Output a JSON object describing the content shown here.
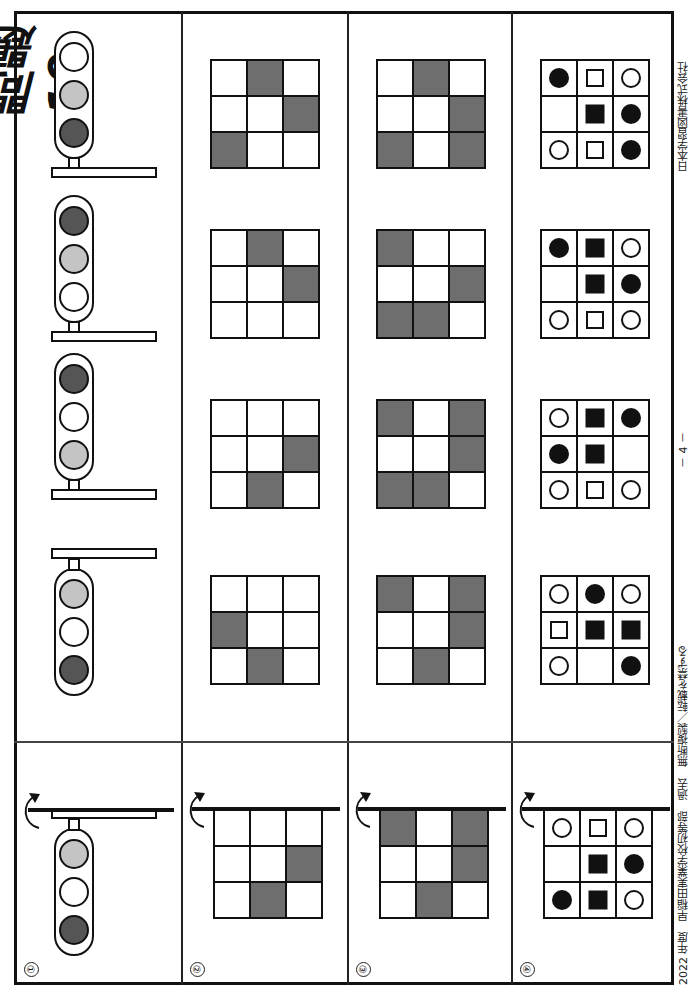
{
  "page": {
    "title": "問題19",
    "footer_left": "2022 年度　早稲田実業学校初等部　過去　無断複製／転載を禁ずる",
    "page_number": "－ 4 －",
    "footer_right": "日本学習図書株式会社"
  },
  "colors": {
    "dark_lamp": "#555555",
    "light_lamp": "#c4c4c4",
    "white_lamp": "#ffffff",
    "grid_fill": "#6e6e6e",
    "ink": "#111111"
  },
  "rows": [
    {
      "number": "①",
      "type": "traffic-light",
      "example": {
        "arm": "top",
        "lamps": [
          "light",
          "white",
          "dark"
        ]
      },
      "options": [
        {
          "arm": "bottom",
          "lamps": [
            "white",
            "light",
            "dark"
          ]
        },
        {
          "arm": "bottom",
          "lamps": [
            "dark",
            "light",
            "white"
          ]
        },
        {
          "arm": "bottom",
          "lamps": [
            "dark",
            "white",
            "light"
          ]
        },
        {
          "arm": "top",
          "lamps": [
            "light",
            "white",
            "dark"
          ]
        }
      ]
    },
    {
      "number": "②",
      "type": "shaded-grid",
      "example": [
        [
          0,
          0,
          0
        ],
        [
          0,
          0,
          1
        ],
        [
          0,
          1,
          0
        ]
      ],
      "options": [
        [
          [
            0,
            1,
            0
          ],
          [
            0,
            0,
            1
          ],
          [
            1,
            0,
            0
          ]
        ],
        [
          [
            0,
            1,
            0
          ],
          [
            0,
            0,
            1
          ],
          [
            0,
            0,
            0
          ]
        ],
        [
          [
            0,
            0,
            0
          ],
          [
            0,
            0,
            1
          ],
          [
            0,
            1,
            0
          ]
        ],
        [
          [
            0,
            0,
            0
          ],
          [
            1,
            0,
            0
          ],
          [
            0,
            1,
            0
          ]
        ]
      ]
    },
    {
      "number": "③",
      "type": "shaded-grid",
      "example": [
        [
          1,
          0,
          1
        ],
        [
          0,
          0,
          1
        ],
        [
          0,
          1,
          0
        ]
      ],
      "options": [
        [
          [
            0,
            1,
            0
          ],
          [
            0,
            0,
            1
          ],
          [
            1,
            0,
            1
          ]
        ],
        [
          [
            1,
            0,
            0
          ],
          [
            0,
            0,
            1
          ],
          [
            1,
            1,
            0
          ]
        ],
        [
          [
            1,
            0,
            1
          ],
          [
            0,
            0,
            1
          ],
          [
            1,
            1,
            0
          ]
        ],
        [
          [
            1,
            0,
            1
          ],
          [
            0,
            0,
            1
          ],
          [
            0,
            1,
            0
          ]
        ]
      ]
    },
    {
      "number": "④",
      "type": "symbol-grid",
      "legend": {
        "O": "circle-o",
        "F": "circle-f",
        "S": "square-o",
        "B": "square-f",
        "_": "empty"
      },
      "example": [
        [
          "O",
          "S",
          "O"
        ],
        [
          "_",
          "B",
          "F"
        ],
        [
          "F",
          "B",
          "O"
        ]
      ],
      "options": [
        [
          [
            "F",
            "S",
            "O"
          ],
          [
            "_",
            "B",
            "F"
          ],
          [
            "O",
            "S",
            "F"
          ]
        ],
        [
          [
            "F",
            "B",
            "O"
          ],
          [
            "_",
            "B",
            "F"
          ],
          [
            "O",
            "S",
            "O"
          ]
        ],
        [
          [
            "O",
            "B",
            "F"
          ],
          [
            "F",
            "B",
            "_"
          ],
          [
            "O",
            "S",
            "O"
          ]
        ],
        [
          [
            "O",
            "F",
            "O"
          ],
          [
            "S",
            "B",
            "B"
          ],
          [
            "O",
            "_",
            "F"
          ]
        ]
      ]
    }
  ]
}
